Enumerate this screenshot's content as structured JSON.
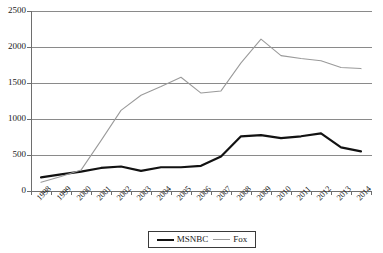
{
  "chart_data": {
    "type": "line",
    "title": "",
    "xlabel": "",
    "ylabel": "",
    "ylim": [
      0,
      2500
    ],
    "yticks": [
      0,
      500,
      1000,
      1500,
      2000,
      2500
    ],
    "grid": true,
    "legend_position": "bottom-center",
    "categories": [
      "1998",
      "1999",
      "2000",
      "2001",
      "2002",
      "2003",
      "2004",
      "2005",
      "2006",
      "2007",
      "2008",
      "2009",
      "2010",
      "2011",
      "2012",
      "2013",
      "2014"
    ],
    "series": [
      {
        "name": "MSNBC",
        "color": "#121212",
        "line_style": "thick-solid",
        "values": [
          190,
          230,
          270,
          320,
          340,
          280,
          330,
          330,
          350,
          480,
          760,
          775,
          735,
          760,
          800,
          605,
          550
        ]
      },
      {
        "name": "Fox",
        "color": "#9a9a9a",
        "line_style": "thin-solid",
        "values": [
          120,
          200,
          290,
          700,
          1120,
          1330,
          1450,
          1580,
          1360,
          1390,
          1780,
          2110,
          1880,
          1840,
          1810,
          1715,
          1700
        ]
      }
    ]
  },
  "axis": {
    "y_tick_labels": [
      "2500",
      "2000",
      "1500",
      "1000",
      "500",
      "0"
    ],
    "x_tick_labels": [
      "1998",
      "1999",
      "2000",
      "2001",
      "2002",
      "2003",
      "2004",
      "2005",
      "2006",
      "2007",
      "2008",
      "2009",
      "2010",
      "2011",
      "2012",
      "2013",
      "2014"
    ]
  },
  "legend": {
    "entries": [
      {
        "label": "MSNBC"
      },
      {
        "label": "Fox"
      }
    ]
  },
  "colors": {
    "msnbc_line": "#121212",
    "fox_line": "#9a9a9a",
    "gridline": "#8a8a8a",
    "axis": "#6e6e6e",
    "text": "#1a1a1a",
    "background": "#ffffff"
  }
}
